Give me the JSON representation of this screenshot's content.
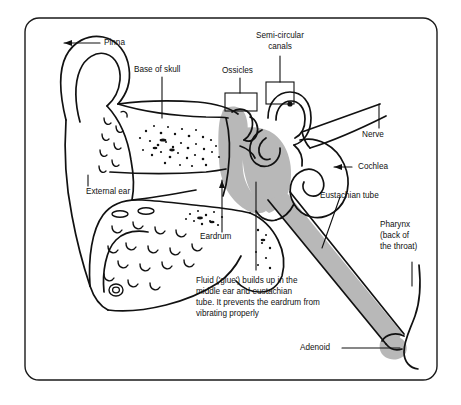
{
  "diagram": {
    "frame": {
      "border_color": "#1a1a1a",
      "background": "#ffffff"
    },
    "colors": {
      "ink": "#111111",
      "fluid_gray": "#b8b8b8",
      "fluid_gray_dark": "#9a9a9a",
      "paper": "#ffffff"
    },
    "labels": [
      {
        "id": "pinna",
        "text": "Pinna"
      },
      {
        "id": "base-of-skull",
        "text": "Base of skull"
      },
      {
        "id": "ossicles",
        "text": "Ossicles"
      },
      {
        "id": "semi-circular-canals-line1",
        "text": "Semi-circular"
      },
      {
        "id": "semi-circular-canals-line2",
        "text": "canals"
      },
      {
        "id": "nerve",
        "text": "Nerve"
      },
      {
        "id": "cochlea",
        "text": "Cochlea"
      },
      {
        "id": "eustachian-tube",
        "text": "Eustachian tube"
      },
      {
        "id": "external-ear",
        "text": "External ear"
      },
      {
        "id": "eardrum",
        "text": "Eardrum"
      },
      {
        "id": "pharynx-line1",
        "text": "Pharynx"
      },
      {
        "id": "pharynx-line2",
        "text": "(back of"
      },
      {
        "id": "pharynx-line3",
        "text": "the throat)"
      },
      {
        "id": "adenoid",
        "text": "Adenoid"
      }
    ],
    "caption": {
      "id": "fluid-caption",
      "lines": [
        "Fluid ('glue') builds up in the",
        "middle ear and eustachian",
        "tube. It prevents the eardrum from",
        "vibrating properly"
      ]
    }
  }
}
